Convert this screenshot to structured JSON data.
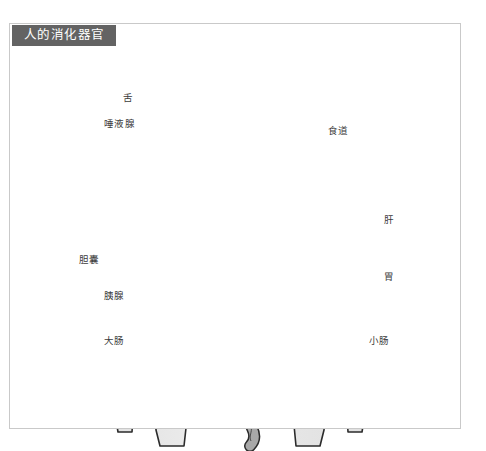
{
  "figure": {
    "title": "人的消化器官",
    "title_color": "#636363",
    "frame_color": "#c9c9c9",
    "background": "#ffffff"
  },
  "labels": [
    {
      "id": "tongue",
      "text": "舌",
      "side": "left",
      "x": 123,
      "y": 98
    },
    {
      "id": "salivary-gland",
      "text": "唾液腺",
      "side": "left",
      "x": 104,
      "y": 124
    },
    {
      "id": "esophagus",
      "text": "食道",
      "side": "right",
      "x": 328,
      "y": 131
    },
    {
      "id": "liver",
      "text": "肝",
      "side": "right",
      "x": 384,
      "y": 220
    },
    {
      "id": "gallbladder",
      "text": "胆囊",
      "side": "left",
      "x": 79,
      "y": 260
    },
    {
      "id": "stomach",
      "text": "胃",
      "side": "right",
      "x": 384,
      "y": 277
    },
    {
      "id": "pancreas",
      "text": "胰腺",
      "side": "left",
      "x": 104,
      "y": 296
    },
    {
      "id": "large-intestine",
      "text": "大肠",
      "side": "left",
      "x": 104,
      "y": 341
    },
    {
      "id": "small-intestine",
      "text": "小肠",
      "side": "right",
      "x": 369,
      "y": 341
    }
  ],
  "palette": {
    "skin_fill": "#e9e9e9",
    "skin_shade": "#dcdcdc",
    "outline": "#2b2b2b",
    "organ_dark": "#8c8c8c",
    "organ_mid": "#a8a8a8",
    "organ_light": "#c4c4c4",
    "leader_line": "#6e6e6e"
  }
}
